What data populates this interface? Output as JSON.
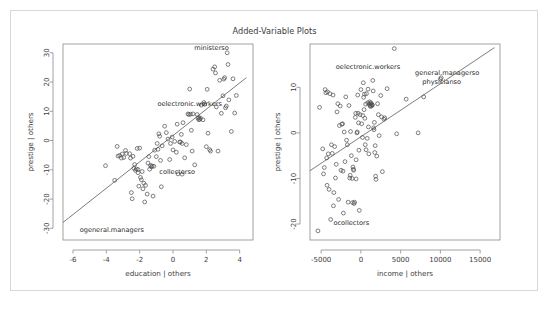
{
  "figure": {
    "title": "Added-Variable Plots",
    "background_color": "#ffffff",
    "border_color": "#d8d8d8",
    "point_color": "#4a4a4a",
    "line_color": "#5a5a5a",
    "text_color": "#3c3c3c"
  },
  "chart_data": [
    {
      "type": "scatter",
      "panel": "left",
      "title": "Added-Variable Plots",
      "xlabel": "education | others",
      "ylabel": "prestige | others",
      "xlim": [
        -6.6,
        4.8
      ],
      "ylim": [
        -34,
        33
      ],
      "xticks": [
        -6,
        -4,
        -2,
        0,
        2,
        4
      ],
      "xticklabels": [
        "-6",
        "-4",
        "-2",
        "0",
        "2",
        "4"
      ],
      "yticks": [
        -30,
        -20,
        -10,
        0,
        10,
        20,
        30
      ],
      "yticklabels": [
        "-30",
        "-20",
        "-10",
        "0",
        "10",
        "20",
        "30"
      ],
      "grid": false,
      "legend": "none",
      "regression_line": {
        "x1": -6.6,
        "y1": -28.0,
        "x2": 4.4,
        "y2": 21.5
      },
      "annotations": [
        {
          "text": "ministerso",
          "x": 3.35,
          "y": 31.0,
          "anchor": "end"
        },
        {
          "text": "oelectronic.workers",
          "x": 1.0,
          "y": 11.8,
          "anchor": "middle"
        },
        {
          "text": "collectorso",
          "x": 0.25,
          "y": -11.6,
          "anchor": "middle"
        },
        {
          "text": "ogeneral.managers",
          "x": -5.6,
          "y": -31.2,
          "anchor": "start"
        }
      ],
      "points": [
        [
          -4.05,
          -8.6
        ],
        [
          -3.5,
          -13.6
        ],
        [
          -3.35,
          -2.0
        ],
        [
          -3.3,
          -5.3
        ],
        [
          -3.2,
          -5.1
        ],
        [
          -3.1,
          -6.0
        ],
        [
          -3.05,
          -4.6
        ],
        [
          -2.95,
          -5.8
        ],
        [
          -2.85,
          -3.4
        ],
        [
          -2.8,
          -4.4
        ],
        [
          -2.6,
          -4.5
        ],
        [
          -2.55,
          -6.0
        ],
        [
          -2.5,
          -17.8
        ],
        [
          -2.45,
          -19.9
        ],
        [
          -2.4,
          -5.4
        ],
        [
          -2.35,
          -9.5
        ],
        [
          -2.3,
          -8.2
        ],
        [
          -2.25,
          -10.2
        ],
        [
          -2.2,
          -9.7
        ],
        [
          -2.15,
          -2.7
        ],
        [
          -2.1,
          -9.9
        ],
        [
          -2.05,
          -15.6
        ],
        [
          -2.0,
          -2.6
        ],
        [
          -1.95,
          -12.6
        ],
        [
          -1.9,
          -13.4
        ],
        [
          -1.85,
          -10.6
        ],
        [
          -1.8,
          -16.5
        ],
        [
          -1.75,
          -14.6
        ],
        [
          -1.7,
          -21.0
        ],
        [
          -1.65,
          -15.3
        ],
        [
          -1.55,
          -18.3
        ],
        [
          -1.5,
          -7.7
        ],
        [
          -1.45,
          -5.5
        ],
        [
          -1.4,
          -9.8
        ],
        [
          -1.35,
          -8.5
        ],
        [
          -1.3,
          -9.0
        ],
        [
          -1.25,
          -8.7
        ],
        [
          -1.2,
          -19.0
        ],
        [
          -1.1,
          -3.3
        ],
        [
          -1.0,
          -5.5
        ],
        [
          -0.95,
          -1.0
        ],
        [
          -0.9,
          -3.0
        ],
        [
          -0.85,
          2.3
        ],
        [
          -0.8,
          1.5
        ],
        [
          -0.75,
          -6.8
        ],
        [
          -0.7,
          -15.8
        ],
        [
          -0.65,
          -1.8
        ],
        [
          -0.5,
          4.9
        ],
        [
          -0.4,
          2.7
        ],
        [
          -0.3,
          0.5
        ],
        [
          -0.2,
          -6.5
        ],
        [
          -0.15,
          -1.0
        ],
        [
          -0.05,
          1.2
        ],
        [
          0.0,
          -3.2
        ],
        [
          0.1,
          -0.3
        ],
        [
          0.2,
          -4.0
        ],
        [
          0.25,
          5.6
        ],
        [
          0.3,
          -11.4
        ],
        [
          0.4,
          -0.5
        ],
        [
          0.45,
          -0.5
        ],
        [
          0.5,
          2.1
        ],
        [
          0.55,
          -1.0
        ],
        [
          0.6,
          6.1
        ],
        [
          0.7,
          -5.9
        ],
        [
          0.8,
          -1.4
        ],
        [
          0.9,
          9.1
        ],
        [
          0.95,
          8.9
        ],
        [
          1.0,
          17.6
        ],
        [
          1.05,
          9.0
        ],
        [
          1.1,
          3.5
        ],
        [
          1.15,
          -3.6
        ],
        [
          1.2,
          9.1
        ],
        [
          1.3,
          -8.3
        ],
        [
          1.45,
          8.9
        ],
        [
          1.5,
          7.6
        ],
        [
          1.55,
          7.1
        ],
        [
          1.6,
          7.3
        ],
        [
          1.65,
          7.6
        ],
        [
          1.7,
          12.1
        ],
        [
          1.8,
          7.1
        ],
        [
          1.85,
          13.0
        ],
        [
          1.9,
          12.4
        ],
        [
          2.0,
          -2.1
        ],
        [
          2.05,
          17.5
        ],
        [
          2.1,
          2.5
        ],
        [
          2.2,
          -3.1
        ],
        [
          2.25,
          -3.6
        ],
        [
          2.4,
          24.4
        ],
        [
          2.5,
          25.2
        ],
        [
          2.55,
          23.1
        ],
        [
          2.6,
          11.5
        ],
        [
          2.7,
          -3.6
        ],
        [
          2.8,
          20.6
        ],
        [
          2.9,
          9.3
        ],
        [
          3.0,
          15.3
        ],
        [
          3.05,
          21.0
        ],
        [
          3.1,
          21.5
        ],
        [
          3.15,
          11.2
        ],
        [
          3.2,
          11.8
        ],
        [
          3.25,
          30.0
        ],
        [
          3.3,
          26.0
        ],
        [
          3.35,
          13.9
        ],
        [
          3.5,
          3.1
        ],
        [
          3.6,
          21.1
        ],
        [
          3.7,
          9.4
        ],
        [
          3.8,
          15.4
        ],
        [
          -2.1,
          -11.0
        ],
        [
          -1.15,
          -8.8
        ],
        [
          0.55,
          -11.5
        ],
        [
          1.55,
          7.9
        ]
      ]
    },
    {
      "type": "scatter",
      "panel": "right",
      "title": "Added-Variable Plots",
      "xlabel": "income | others",
      "ylabel": "prestige | others",
      "xlim": [
        -6400,
        17500
      ],
      "ylim": [
        -23.5,
        19.5
      ],
      "xticks": [
        -5000,
        0,
        5000,
        10000,
        15000
      ],
      "xticklabels": [
        "-5000",
        "0",
        "5000",
        "10000",
        "15000"
      ],
      "yticks": [
        -20,
        -10,
        0,
        10
      ],
      "yticklabels": [
        "-20",
        "-10",
        "0",
        "10"
      ],
      "grid": false,
      "legend": "none",
      "regression_line": {
        "x1": -6400,
        "y1": -8.3,
        "x2": 16800,
        "y2": 18.7
      },
      "annotations": [
        {
          "text": "oelectronic.workers",
          "x": 900,
          "y": 14.0,
          "anchor": "middle"
        },
        {
          "text": "general.managerso",
          "x": 14900,
          "y": 12.7,
          "anchor": "end"
        },
        {
          "text": "physicianso",
          "x": 12600,
          "y": 10.8,
          "anchor": "end"
        },
        {
          "text": "ocollectors",
          "x": -1200,
          "y": -20.2,
          "anchor": "middle"
        }
      ],
      "points": [
        [
          -5400,
          -21.5
        ],
        [
          -5200,
          5.6
        ],
        [
          -4700,
          -9.0
        ],
        [
          -4600,
          -7.6
        ],
        [
          -4500,
          9.5
        ],
        [
          -4400,
          8.8
        ],
        [
          -4300,
          -5.5
        ],
        [
          -4250,
          -11.5
        ],
        [
          -4200,
          9.0
        ],
        [
          -4100,
          -4.6
        ],
        [
          -4000,
          -12.4
        ],
        [
          -3900,
          8.6
        ],
        [
          -3800,
          -19.0
        ],
        [
          -3700,
          -2.6
        ],
        [
          -3600,
          -4.5
        ],
        [
          -3500,
          8.3
        ],
        [
          -3400,
          -13.1
        ],
        [
          -3300,
          -3.0
        ],
        [
          -3200,
          -9.9
        ],
        [
          -3100,
          -6.9
        ],
        [
          -3000,
          4.6
        ],
        [
          -2900,
          6.4
        ],
        [
          -2800,
          -14.6
        ],
        [
          -2700,
          1.6
        ],
        [
          -2600,
          5.9
        ],
        [
          -2500,
          -8.2
        ],
        [
          -2400,
          1.9
        ],
        [
          -2300,
          2.0
        ],
        [
          -2250,
          -8.4
        ],
        [
          -2200,
          -17.6
        ],
        [
          -2100,
          0.2
        ],
        [
          -2000,
          -6.3
        ],
        [
          -1900,
          7.9
        ],
        [
          -1800,
          -1.6
        ],
        [
          -1700,
          -2.6
        ],
        [
          -1600,
          -15.2
        ],
        [
          -1500,
          6.0
        ],
        [
          -1400,
          -9.9
        ],
        [
          -1350,
          -9.3
        ],
        [
          -1300,
          0.3
        ],
        [
          -1200,
          -5.0
        ],
        [
          -1100,
          -10.0
        ],
        [
          -1000,
          -7.5
        ],
        [
          -950,
          -8.0
        ],
        [
          -900,
          -8.2
        ],
        [
          -850,
          -15.5
        ],
        [
          -800,
          -15.2
        ],
        [
          -700,
          3.4
        ],
        [
          -650,
          4.3
        ],
        [
          -600,
          -5.9
        ],
        [
          -500,
          0.0
        ],
        [
          -450,
          0.2
        ],
        [
          -400,
          8.3
        ],
        [
          -350,
          4.3
        ],
        [
          -300,
          2.2
        ],
        [
          -250,
          -3.8
        ],
        [
          -200,
          -17.0
        ],
        [
          -100,
          4.0
        ],
        [
          0,
          9.5
        ],
        [
          100,
          2.0
        ],
        [
          200,
          -1.0
        ],
        [
          250,
          3.8
        ],
        [
          300,
          11.0
        ],
        [
          350,
          7.8
        ],
        [
          400,
          5.1
        ],
        [
          450,
          8.5
        ],
        [
          500,
          3.2
        ],
        [
          550,
          -2.6
        ],
        [
          600,
          6.3
        ],
        [
          650,
          -3.7
        ],
        [
          700,
          8.6
        ],
        [
          800,
          -1.2
        ],
        [
          850,
          6.6
        ],
        [
          900,
          9.6
        ],
        [
          950,
          1.3
        ],
        [
          1000,
          -4.6
        ],
        [
          1050,
          6.3
        ],
        [
          1100,
          6.8
        ],
        [
          1150,
          6.0
        ],
        [
          1200,
          5.8
        ],
        [
          1250,
          6.6
        ],
        [
          1300,
          6.4
        ],
        [
          1350,
          5.9
        ],
        [
          1400,
          6.2
        ],
        [
          1450,
          6.1
        ],
        [
          1500,
          11.5
        ],
        [
          1550,
          9.2
        ],
        [
          1600,
          1.1
        ],
        [
          1650,
          0.7
        ],
        [
          1700,
          2.3
        ],
        [
          1750,
          -4.3
        ],
        [
          1800,
          -2.8
        ],
        [
          1850,
          -9.5
        ],
        [
          1900,
          -10.2
        ],
        [
          2000,
          -5.1
        ],
        [
          2100,
          6.4
        ],
        [
          2200,
          4.0
        ],
        [
          2300,
          -0.6
        ],
        [
          2500,
          8.2
        ],
        [
          2600,
          3.5
        ],
        [
          2700,
          -8.5
        ],
        [
          2900,
          3.0
        ],
        [
          3000,
          3.3
        ],
        [
          3300,
          9.7
        ],
        [
          4200,
          18.5
        ],
        [
          4500,
          -0.2
        ],
        [
          5700,
          7.4
        ],
        [
          7200,
          0.0
        ],
        [
          7900,
          7.9
        ],
        [
          10000,
          11.8
        ],
        [
          10100,
          12.1
        ],
        [
          -4800,
          -3.5
        ],
        [
          -3450,
          -16.0
        ],
        [
          -1050,
          -15.3
        ],
        [
          -600,
          -10.1
        ]
      ]
    }
  ]
}
